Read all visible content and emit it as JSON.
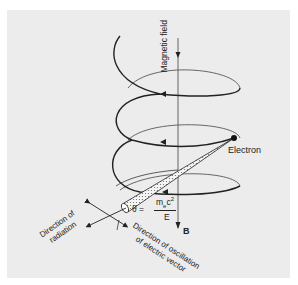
{
  "diagram": {
    "labels": {
      "magnetic_field": "Magnetic field",
      "electron": "Electron",
      "field_symbol": "B",
      "direction_radiation_line1": "Direction of",
      "direction_radiation_line2": "radiation",
      "direction_oscillation_line1": "Direction of oscillation",
      "direction_oscillation_line2": "of electric vector"
    },
    "formula": {
      "lhs": "θ =",
      "numerator": "m",
      "numerator_sub": "e",
      "numerator_rest": "c",
      "numerator_sup": "2",
      "denominator": "E"
    },
    "colors": {
      "background": "#ececec",
      "ink": "#222222",
      "axis": "#555555"
    }
  }
}
